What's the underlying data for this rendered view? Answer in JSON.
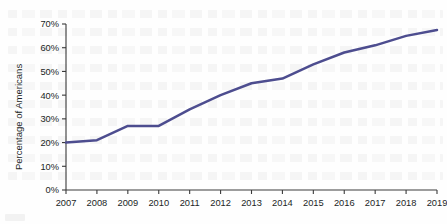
{
  "chart_data": {
    "type": "line",
    "title": "",
    "xlabel": "",
    "ylabel": "Percentage of Americans",
    "categories": [
      "2007",
      "2008",
      "2009",
      "2010",
      "2011",
      "2012",
      "2013",
      "2014",
      "2015",
      "2016",
      "2017",
      "2018",
      "2019"
    ],
    "x": [
      2007,
      2008,
      2009,
      2010,
      2011,
      2012,
      2013,
      2014,
      2015,
      2016,
      2017,
      2018,
      2019
    ],
    "values": [
      20,
      21,
      27,
      27,
      34,
      40,
      45,
      47,
      53,
      58,
      61,
      65,
      67.5
    ],
    "series": [
      {
        "name": "Percentage of Americans",
        "values": [
          20,
          21,
          27,
          27,
          34,
          40,
          45,
          47,
          53,
          58,
          61,
          65,
          67.5
        ]
      }
    ],
    "ylim": [
      0,
      70
    ],
    "xlim": [
      2007,
      2019
    ],
    "yticks": [
      0,
      10,
      20,
      30,
      40,
      50,
      60,
      70
    ],
    "ytick_labels": [
      "0%",
      "10%",
      "20%",
      "30%",
      "40%",
      "50%",
      "60%",
      "70%"
    ],
    "xtick_labels": [
      "2007",
      "2008",
      "2009",
      "2010",
      "2011",
      "2012",
      "2013",
      "2014",
      "2015",
      "2016",
      "2017",
      "2018",
      "2019"
    ],
    "grid": false,
    "legend": "none",
    "line_color": "#4d4d8f",
    "axis_color": "#3a3a3a",
    "text_color": "#221f1f",
    "background": "#fefefe"
  }
}
